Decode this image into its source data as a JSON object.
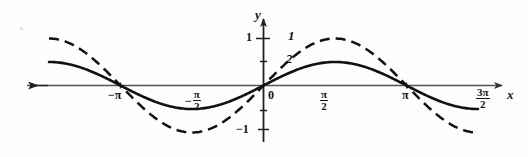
{
  "chart_data": {
    "type": "line",
    "title": "",
    "xlabel": "x",
    "ylabel": "y",
    "xlim": [
      -4.71238898038469,
      4.71238898038469
    ],
    "ylim": [
      -1.35,
      1.35
    ],
    "grid": false,
    "legend": "inline-curve-labels",
    "x_ticks": [
      {
        "value": -3.141592653589793,
        "label": "−π",
        "kind": "plain"
      },
      {
        "value": -1.570796326794897,
        "label": "−π/2",
        "kind": "fraction",
        "sign": "−",
        "numerator": "π",
        "denominator": "2"
      },
      {
        "value": 0.0,
        "label": "0",
        "kind": "plain"
      },
      {
        "value": 1.570796326794897,
        "label": "π/2",
        "kind": "fraction",
        "sign": "",
        "numerator": "π",
        "denominator": "2"
      },
      {
        "value": 3.141592653589793,
        "label": "π",
        "kind": "plain"
      },
      {
        "value": 4.71238898038469,
        "label": "3π/2",
        "kind": "fraction",
        "sign": "",
        "numerator": "3π",
        "denominator": "2"
      }
    ],
    "y_ticks": [
      {
        "value": 1,
        "label": "1"
      },
      {
        "value": -1,
        "label": "−1"
      }
    ],
    "series": [
      {
        "name": "1",
        "curve_label": "1",
        "style": "dashed",
        "color": "#111111",
        "amplitude": 1.0,
        "function": "y = sin(x)",
        "x_start": -4.71238898038469,
        "x_end": 4.71238898038469,
        "key_points": [
          {
            "x": -4.71238898038469,
            "y": 0
          },
          {
            "x": -3.141592653589793,
            "y": -1
          },
          {
            "x": -1.570796326794897,
            "y": 0
          },
          {
            "x": 0.0,
            "y": 1
          },
          {
            "x": 1.570796326794897,
            "y": 0
          },
          {
            "x": 3.141592653589793,
            "y": -1
          },
          {
            "x": 4.71238898038469,
            "y": 0
          }
        ]
      },
      {
        "name": "2",
        "curve_label": "2",
        "style": "solid",
        "color": "#111111",
        "amplitude": 0.5,
        "function": "y = 0.5 sin(x)",
        "x_start": -4.71238898038469,
        "x_end": 4.71238898038469,
        "key_points": [
          {
            "x": -4.71238898038469,
            "y": 0
          },
          {
            "x": -3.141592653589793,
            "y": -0.5
          },
          {
            "x": -1.570796326794897,
            "y": 0
          },
          {
            "x": 0.0,
            "y": 0.5
          },
          {
            "x": 1.570796326794897,
            "y": 0
          },
          {
            "x": 3.141592653589793,
            "y": -0.5
          },
          {
            "x": 4.71238898038469,
            "y": 0
          }
        ]
      }
    ],
    "annotations": [
      {
        "text": "1",
        "role": "curve-id-dashed"
      },
      {
        "text": "2",
        "role": "curve-id-solid"
      }
    ]
  },
  "axes": {
    "x_axis_label": "x",
    "y_axis_label": "y",
    "origin_label": "0"
  },
  "ticks": {
    "neg_pi": "−π",
    "pi": "π",
    "minus_sign": "−",
    "pi_glyph": "π",
    "two": "2",
    "three_pi": "3π",
    "y_one": "1",
    "y_minus_one": "−1"
  },
  "curve_labels": {
    "dashed": "1",
    "solid": "2"
  }
}
